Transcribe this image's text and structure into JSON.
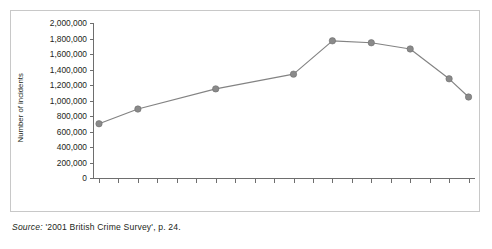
{
  "figure": {
    "source_prefix": "Source:",
    "source_text": " '2001 British Crime Survey', p. 24."
  },
  "chart_data": {
    "type": "line",
    "title": "",
    "xlabel": "",
    "ylabel": "Number of incidents",
    "ylim": [
      0,
      2000000
    ],
    "ytick_step": 200000,
    "grid": false,
    "legend": "none",
    "marker": "filled-circle",
    "line_color": "#838383",
    "marker_color": "#8a8a8a",
    "x_axis_ticks": [
      "1981",
      "1982",
      "1983",
      "1984",
      "1985",
      "1986",
      "1987",
      "1988",
      "1989",
      "1990",
      "1991",
      "1992",
      "1993",
      "1994",
      "1995",
      "1996",
      "1997",
      "1998",
      "1999",
      "2000"
    ],
    "x_tick_labels_shown": [
      "1981",
      "1983",
      "1987",
      "1991",
      "1993",
      "1995",
      "1997",
      "1999",
      "2000"
    ],
    "ytick_labels": [
      "0",
      "200,000",
      "400,000",
      "600,000",
      "800,000",
      "1,000,000",
      "1,200,000",
      "1,400,000",
      "1,600,000",
      "1,800,000",
      "2,000,000"
    ],
    "categories": [
      "1981",
      "1983",
      "1987",
      "1991",
      "1993",
      "1995",
      "1997",
      "1999",
      "2000"
    ],
    "values": [
      700000,
      890000,
      1150000,
      1340000,
      1770000,
      1745000,
      1665000,
      1280000,
      1045000
    ]
  }
}
